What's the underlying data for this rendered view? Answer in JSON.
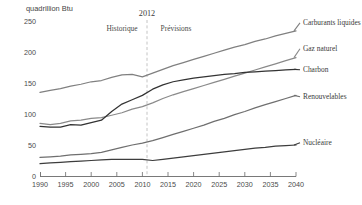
{
  "figure": {
    "unit_label": "quadrillion Btu",
    "divider_year_label": "2012",
    "period_left_label": "Historique",
    "period_right_label": "Prévisions"
  },
  "chart_data": {
    "type": "line",
    "title": "",
    "subtitle": "",
    "xlabel": "",
    "ylabel": "quadrillion Btu",
    "xlim": [
      1990,
      2040
    ],
    "ylim": [
      0,
      250
    ],
    "yticks": [
      0,
      50,
      100,
      150,
      200,
      250
    ],
    "xticks": [
      1990,
      1995,
      2000,
      2005,
      2010,
      2015,
      2020,
      2025,
      2030,
      2035,
      2040
    ],
    "grid": false,
    "legend_position": "right-inline",
    "annotations": [
      {
        "text": "2012",
        "x": 2012,
        "type": "divider-year"
      },
      {
        "text": "Historique",
        "x": 2003,
        "type": "region-label"
      },
      {
        "text": "Prévisions",
        "x": 2021,
        "type": "region-label"
      }
    ],
    "divider": {
      "x": 2012,
      "style": "dashed",
      "color": "#b9b9b9"
    },
    "x": [
      1990,
      1992,
      1994,
      1996,
      1998,
      2000,
      2002,
      2004,
      2006,
      2008,
      2010,
      2012,
      2014,
      2016,
      2018,
      2020,
      2022,
      2024,
      2026,
      2028,
      2030,
      2032,
      2034,
      2036,
      2038,
      2040
    ],
    "series": [
      {
        "name": "Carburants liquides",
        "color": "#808080",
        "values": [
          135,
          138,
          141,
          145,
          148,
          152,
          154,
          159,
          163,
          164,
          160,
          166,
          172,
          178,
          183,
          188,
          193,
          198,
          203,
          208,
          212,
          217,
          221,
          226,
          230,
          234
        ]
      },
      {
        "name": "Gaz naturel",
        "color": "#8a8a8a",
        "values": [
          85,
          83,
          85,
          89,
          90,
          93,
          94,
          98,
          102,
          108,
          112,
          118,
          125,
          131,
          136,
          141,
          146,
          151,
          156,
          161,
          166,
          171,
          176,
          181,
          186,
          191
        ]
      },
      {
        "name": "Charbon",
        "color": "#333333",
        "values": [
          80,
          79,
          79,
          83,
          82,
          86,
          90,
          104,
          116,
          123,
          130,
          140,
          147,
          152,
          155,
          158,
          160,
          162,
          164,
          165,
          167,
          168,
          169,
          170,
          171,
          172
        ]
      },
      {
        "name": "Renouvelables",
        "color": "#6f6f6f",
        "values": [
          30,
          31,
          32,
          34,
          35,
          36,
          38,
          42,
          46,
          50,
          53,
          57,
          62,
          67,
          72,
          77,
          82,
          88,
          93,
          99,
          104,
          110,
          115,
          120,
          125,
          130
        ]
      },
      {
        "name": "Nucléaire",
        "color": "#3d3d3d",
        "values": [
          20,
          21,
          22,
          23,
          24,
          25,
          26,
          27,
          27,
          27,
          27,
          25,
          27,
          29,
          31,
          33,
          35,
          37,
          39,
          41,
          43,
          45,
          46,
          48,
          49,
          50
        ]
      }
    ],
    "series_labels": [
      {
        "name": "Carburants liquides",
        "value_at_end": 234
      },
      {
        "name": "Gaz naturel",
        "value_at_end": 191
      },
      {
        "name": "Charbon",
        "value_at_end": 172
      },
      {
        "name": "Renouvelables",
        "value_at_end": 130
      },
      {
        "name": "Nucléaire",
        "value_at_end": 50
      }
    ]
  }
}
